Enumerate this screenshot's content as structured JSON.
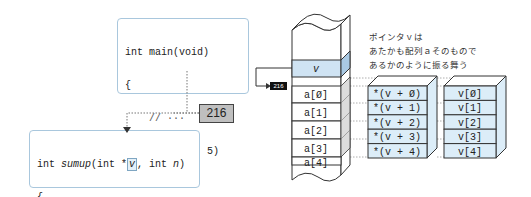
{
  "main_code": {
    "lines": [
      "int main(void)",
      "{",
      "    // ···",
      "    sumup(",
      "a",
      ", 5)",
      "    // ···",
      "}"
    ]
  },
  "sumup_code": {
    "signature_pre": "int ",
    "func_name": "sumup",
    "signature_mid": "(int *",
    "param_v": "v",
    "signature_post": ", int ",
    "param_n": "n",
    "close_paren": ")",
    "lines": [
      "{",
      "    // ···",
      "}"
    ]
  },
  "address_tag": "216",
  "address_small": "216",
  "memory": {
    "pointer_cell": "v",
    "cells": [
      "a[Ø]",
      "a[1]",
      "a[2]",
      "a[3]",
      "a[4]"
    ]
  },
  "deref_stack": [
    "*(v + Ø)",
    "*(v + 1)",
    "*(v + 2)",
    "*(v + 3)",
    "*(v + 4)"
  ],
  "index_stack": [
    "v[Ø]",
    "v[1]",
    "v[2]",
    "v[3]",
    "v[4]"
  ],
  "note_lines": [
    "ポインタｖは",
    "あたかも配列ａそのもので",
    "あるかのように振る舞う"
  ],
  "colors": {
    "box_border": "#a9c7dd",
    "cell_fill": "#dcedf8",
    "pointer_fill": "#cfe3f3",
    "addr_tag_fill": "#bfbfbf"
  }
}
